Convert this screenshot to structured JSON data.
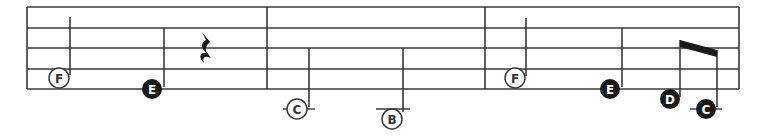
{
  "colors": {
    "staff": "#3a3a3a",
    "note_fill_dark": "#1a1a1a",
    "note_fill_light": "#ffffff",
    "text_on_dark": "#ffffff",
    "text_on_light": "#333333",
    "background": "#ffffff"
  },
  "staff": {
    "left": 27,
    "right": 739,
    "lines_y": [
      7,
      28,
      48,
      69,
      89
    ],
    "barlines_x": [
      27,
      267,
      485,
      739
    ]
  },
  "measures": [
    {
      "index": 1,
      "notes": [
        {
          "letter": "F",
          "style": "open",
          "cx": 59,
          "cy": 78,
          "stem_x": 70,
          "stem_top": 17,
          "stem_bottom": 75,
          "ledger": null
        },
        {
          "letter": "E",
          "style": "filled",
          "cx": 152,
          "cy": 89,
          "stem_x": 164,
          "stem_top": 28,
          "stem_bottom": 87,
          "ledger": null
        }
      ],
      "rests": [
        {
          "type": "quarter-rest",
          "x": 205,
          "y": 32
        }
      ]
    },
    {
      "index": 2,
      "notes": [
        {
          "letter": "C",
          "style": "open",
          "cx": 297,
          "cy": 109,
          "stem_x": 309,
          "stem_top": 48,
          "stem_bottom": 107,
          "ledger": {
            "x1": 283,
            "x2": 315,
            "y": 109
          }
        },
        {
          "letter": "B",
          "style": "open",
          "cx": 392,
          "cy": 119,
          "stem_x": 403,
          "stem_top": 48,
          "stem_bottom": 112,
          "ledger": {
            "x1": 376,
            "x2": 410,
            "y": 109
          }
        }
      ],
      "rests": []
    },
    {
      "index": 3,
      "notes": [
        {
          "letter": "F",
          "style": "open",
          "cx": 515,
          "cy": 78,
          "stem_x": 526,
          "stem_top": 18,
          "stem_bottom": 76,
          "ledger": null
        },
        {
          "letter": "E",
          "style": "filled",
          "cx": 610,
          "cy": 89,
          "stem_x": 622,
          "stem_top": 28,
          "stem_bottom": 87,
          "ledger": null
        },
        {
          "letter": "D",
          "style": "filled",
          "cx": 670,
          "cy": 99,
          "stem_x": 680,
          "stem_top": 40,
          "stem_bottom": 97,
          "ledger": null
        },
        {
          "letter": "C",
          "style": "filled",
          "cx": 706,
          "cy": 109,
          "stem_x": 717,
          "stem_top": 50,
          "stem_bottom": 107,
          "ledger": {
            "x1": 690,
            "x2": 722,
            "y": 109
          }
        }
      ],
      "beams": [
        {
          "x1": 680,
          "y1": 40,
          "x2": 717,
          "y2": 50,
          "thickness": 7
        }
      ],
      "rests": []
    }
  ]
}
